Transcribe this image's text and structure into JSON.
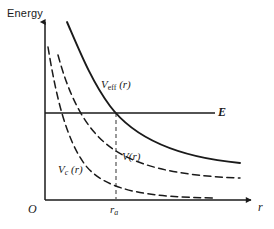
{
  "figure": {
    "kind": "physics-potential-diagram",
    "background_color": "#ffffff",
    "ink_color": "#1a1a1a"
  },
  "axes": {
    "y_axis": {
      "name": "energy-axis",
      "title": "Energy",
      "arrow": true,
      "x_px": 45,
      "top_px": 18,
      "bottom_px": 200
    },
    "x_axis": {
      "name": "radius-axis",
      "title": "r",
      "arrow": true,
      "y_px": 200,
      "left_px": 45,
      "right_px": 255
    },
    "origin_label": "O"
  },
  "annotations": {
    "energy_level": {
      "label": "E",
      "y_px": 113,
      "from_px": 45,
      "to_px": 215,
      "style": "solid"
    },
    "turning_point": {
      "label_main": "r",
      "label_sub": "a",
      "x_px": 116,
      "from_y_px": 113,
      "to_y_px": 200,
      "style": "dashed"
    }
  },
  "curves": [
    {
      "name": "v-eff",
      "label_main": "V",
      "label_sub": "eff",
      "label_arg": " (r)",
      "style": "solid",
      "color": "#1a1a1a",
      "width": 1.9,
      "path": "M 67,22 C 80,52 92,82 110,106 C 134,138 176,157 240,163"
    },
    {
      "name": "v-coulomb-plus-centrifugal",
      "label_main": "V",
      "label_sub": "",
      "label_arg": "(r)",
      "style": "dashed",
      "color": "#1a1a1a",
      "width": 1.5,
      "path": "M 58,55 C 68,92 82,123 104,142 C 132,167 180,176 240,178"
    },
    {
      "name": "v-centrifugal",
      "label_main": "V",
      "label_sub": "c",
      "label_arg": " (r)",
      "style": "dashed",
      "color": "#1a1a1a",
      "width": 1.5,
      "path": "M 48,47 C 56,96 66,140 86,166 C 108,192 150,197 215,198"
    }
  ]
}
